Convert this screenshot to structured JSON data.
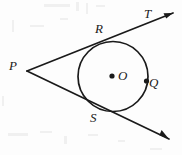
{
  "figure": {
    "kind": "geometry-diagram",
    "background_color": "#fdfdfd",
    "ink_color": "#1a1a1a",
    "stroke_width": 1.6,
    "labels": {
      "p": "P",
      "r": "R",
      "s": "S",
      "t": "T",
      "o": "O",
      "q": "Q"
    },
    "geometry": {
      "circle": {
        "cx": 113,
        "cy": 76.5,
        "r": 35
      },
      "external_point": {
        "x": 27,
        "y": 71
      },
      "tangent_point_r": {
        "x": 103,
        "y": 41.5
      },
      "tangent_point_s": {
        "x": 94.5,
        "y": 110
      },
      "point_q": {
        "x": 146.5,
        "y": 81
      },
      "center_dot": {
        "x": 112,
        "y": 76
      },
      "upper_ray_end": {
        "x": 173,
        "y": 13
      },
      "lower_ray_end": {
        "x": 169,
        "y": 139
      }
    },
    "label_positions": {
      "p": {
        "x": 9,
        "y": 59
      },
      "r": {
        "x": 95,
        "y": 22
      },
      "s": {
        "x": 90,
        "y": 111
      },
      "t": {
        "x": 144,
        "y": 7
      },
      "o": {
        "x": 118,
        "y": 69
      },
      "q": {
        "x": 149,
        "y": 76
      }
    }
  }
}
